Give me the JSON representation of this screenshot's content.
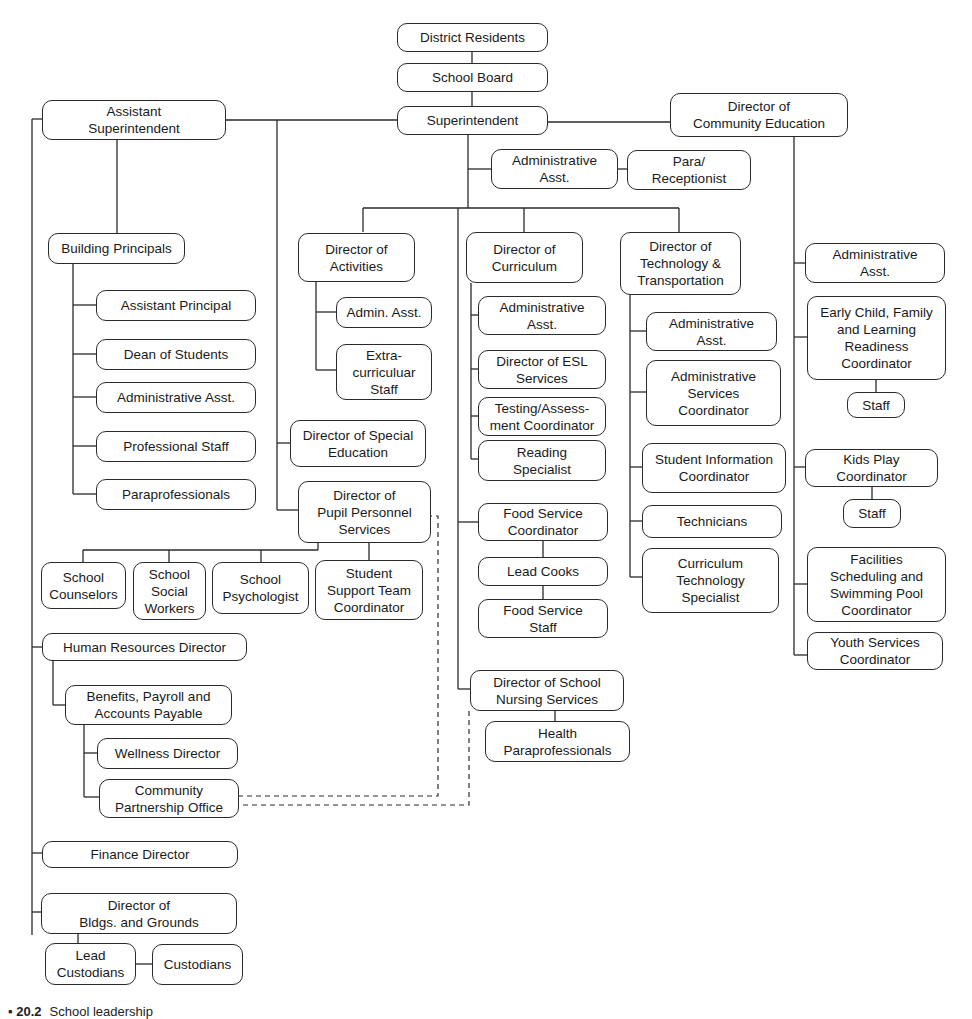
{
  "diagram": {
    "type": "organizational-chart",
    "nodes": {
      "district_residents": "District Residents",
      "school_board": "School Board",
      "superintendent": "Superintendent",
      "assistant_superintendent": "Assistant\nSuperintendent",
      "director_community_education": "Director of\nCommunity Education",
      "supt_admin_asst": "Administrative\nAsst.",
      "para_receptionist": "Para/\nReceptionist",
      "building_principals": "Building Principals",
      "assistant_principal": "Assistant Principal",
      "dean_of_students": "Dean of Students",
      "bp_admin_asst": "Administrative Asst.",
      "professional_staff": "Professional Staff",
      "paraprofessionals": "Paraprofessionals",
      "director_activities": "Director of\nActivities",
      "activities_admin_asst": "Admin. Asst.",
      "extracurricular_staff": "Extra-\ncurriculuar\nStaff",
      "director_special_education": "Director of Special\nEducation",
      "director_pupil_personnel": "Director of\nPupil Personnel\nServices",
      "school_counselors": "School\nCounselors",
      "school_social_workers": "School\nSocial\nWorkers",
      "school_psychologist": "School\nPsychologist",
      "student_support_team": "Student\nSupport Team\nCoordinator",
      "director_curriculum": "Director of\nCurriculum",
      "curr_admin_asst": "Administrative\nAsst.",
      "director_esl": "Director of ESL\nServices",
      "testing_assessment": "Testing/Assess-\nment Coordinator",
      "reading_specialist": "Reading\nSpecialist",
      "food_service_coordinator": "Food Service\nCoordinator",
      "lead_cooks": "Lead Cooks",
      "food_service_staff": "Food Service\nStaff",
      "director_nursing": "Director of School\nNursing Services",
      "health_paraprofessionals": "Health\nParaprofessionals",
      "director_tech_transport": "Director of\nTechnology &\nTransportation",
      "tech_admin_asst": "Administrative\nAsst.",
      "admin_services_coordinator": "Administrative\nServices\nCoordinator",
      "student_info_coordinator": "Student Information\nCoordinator",
      "technicians": "Technicians",
      "curriculum_tech_specialist": "Curriculum\nTechnology\nSpecialist",
      "ce_admin_asst": "Administrative\nAsst.",
      "early_child_coordinator": "Early Child, Family\nand Learning\nReadiness\nCoordinator",
      "early_child_staff": "Staff",
      "kids_play_coordinator": "Kids Play\nCoordinator",
      "kids_play_staff": "Staff",
      "facilities_pool_coordinator": "Facilities\nScheduling and\nSwimming Pool\nCoordinator",
      "youth_services_coordinator": "Youth Services\nCoordinator",
      "hr_director": "Human Resources Director",
      "benefits_payroll": "Benefits, Payroll and\nAccounts Payable",
      "wellness_director": "Wellness Director",
      "community_partnership": "Community\nPartnership Office",
      "finance_director": "Finance Director",
      "director_buildings_grounds": "Director of\nBldgs. and Grounds",
      "lead_custodians": "Lead\nCustodians",
      "custodians": "Custodians"
    },
    "dashed_links": [
      "Community Partnership Office — Director of Pupil Personnel Services",
      "Community Partnership Office — Director of School Nursing Services"
    ],
    "caption": {
      "label": "▪ 20.2",
      "text": "School leadership"
    },
    "colors": {
      "line": "#2a2a2a",
      "box_border": "#2a2a2a",
      "background": "#ffffff",
      "text": "#1a1a1a"
    }
  }
}
